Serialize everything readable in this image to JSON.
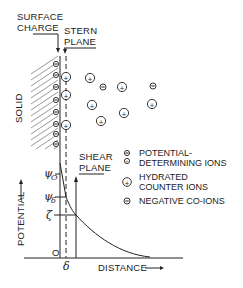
{
  "labels": {
    "surface_charge_line1": "SURFACE",
    "surface_charge_line2": "CHARGE",
    "stern_plane_line1": "STERN",
    "stern_plane_line2": "PLANE",
    "shear_plane_line1": "SHEAR",
    "shear_plane_line2": "PLANE",
    "solid": "SOLID",
    "potential_axis": "POTENTIAL",
    "distance_axis": "DISTANCE",
    "origin": "O",
    "delta": "δ",
    "psi": "ψ",
    "psi_0_sub": "O",
    "psi_delta_sub": "δ",
    "zeta": "ζ"
  },
  "legend": {
    "items": [
      {
        "symbol": "potential-determining-ion",
        "line1": "POTENTIAL-",
        "line2": "DETERMINING IONS"
      },
      {
        "symbol": "hydrated-counter-ion",
        "line1": "HYDRATED",
        "line2": "COUNTER IONS"
      },
      {
        "symbol": "negative-co-ion",
        "line1": "NEGATIVE CO-IONS",
        "line2": ""
      }
    ]
  },
  "colors": {
    "ink": "#222222",
    "background": "#ffffff"
  }
}
